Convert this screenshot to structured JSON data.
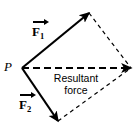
{
  "figure": {
    "name": "resultant-force-parallelogram",
    "width": 138,
    "height": 134,
    "background_color": "#ffffff",
    "stroke_color": "#000000"
  },
  "labels": {
    "origin_point": "P",
    "force1_symbol": "F",
    "force1_subscript": "1",
    "force2_symbol": "F",
    "force2_subscript": "2",
    "resultant_line1": "Resultant",
    "resultant_line2": "force"
  },
  "geometry": {
    "origin": {
      "x": 22,
      "y": 68
    },
    "force1_tip": {
      "x": 89,
      "y": 13
    },
    "force2_tip": {
      "x": 58,
      "y": 121
    },
    "resultant_tip": {
      "x": 131,
      "y": 68
    },
    "force1_path": "M22,68 L89,13",
    "force2_path": "M22,68 L58,121",
    "resultant_path": "M22,68 L131,68",
    "dashed_side_upper_path": "M89,13 L131,68",
    "dashed_side_lower_path": "M58,121 L131,68",
    "solid_stroke_width": 2.2,
    "resultant_stroke_width": 2.2,
    "construction_stroke_width": 1.2,
    "resultant_dash_pattern": "7,4",
    "construction_dash_pattern": "4,3.5"
  }
}
